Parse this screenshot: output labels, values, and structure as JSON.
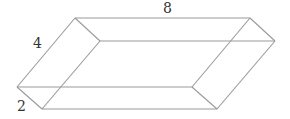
{
  "diagram": {
    "type": "rectangular-prism",
    "colors": {
      "edge": "#9a9a9a",
      "label": "#333333",
      "background": "#ffffff"
    },
    "dimensions": {
      "length": {
        "label": "8"
      },
      "width": {
        "label": "4"
      },
      "height": {
        "label": "2"
      }
    },
    "vertices": {
      "top_back_left": [
        75,
        18
      ],
      "top_back_right": [
        250,
        18
      ],
      "top_front_left": [
        100,
        41
      ],
      "top_front_right": [
        275,
        41
      ],
      "bot_back_left": [
        17,
        87
      ],
      "bot_back_right": [
        192,
        87
      ],
      "bot_front_left": [
        42,
        109
      ],
      "bot_front_right": [
        217,
        109
      ]
    }
  }
}
